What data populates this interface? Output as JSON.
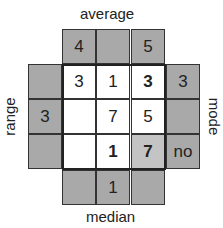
{
  "labels": {
    "top": "average",
    "bottom": "median",
    "left": "range",
    "right": "mode"
  },
  "average_row": [
    "4",
    "",
    "5"
  ],
  "grid": [
    [
      "3",
      "1",
      "3"
    ],
    [
      "",
      "7",
      "5"
    ],
    [
      "",
      "1",
      "7"
    ]
  ],
  "range_col": [
    "",
    "3",
    ""
  ],
  "mode_col": [
    "3",
    "",
    "no"
  ],
  "median_row": [
    "",
    "1",
    ""
  ]
}
